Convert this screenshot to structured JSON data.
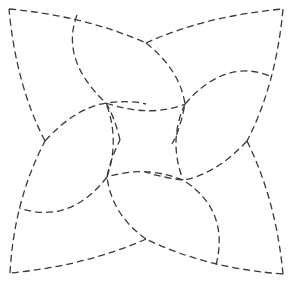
{
  "diagram": {
    "title": "",
    "type": "dashed quilting pinwheel pattern",
    "stroke_color": "#3a3a3a",
    "background": "#ffffff",
    "key_points": {
      "top_left": [
        9,
        9
      ],
      "top_right": [
        283,
        9
      ],
      "bottom_right": [
        283,
        274
      ],
      "bottom_left": [
        10,
        273
      ],
      "top_mid": [
        146,
        43
      ],
      "right_mid": [
        247,
        141
      ],
      "bottom_mid": [
        146,
        239
      ],
      "left_mid": [
        45,
        141
      ],
      "inner_tl": [
        106,
        103
      ],
      "inner_tr": [
        185,
        104
      ],
      "inner_br": [
        183,
        180
      ],
      "inner_bl": [
        107,
        177
      ]
    },
    "paths": [
      {
        "name": "outer-top-left-arc",
        "d": "M9 9 Q85 16 146 43"
      },
      {
        "name": "outer-top-right-arc",
        "d": "M146 43 Q205 16 283 9"
      },
      {
        "name": "outer-right-top-arc",
        "d": "M283 9 Q276 85 247 141"
      },
      {
        "name": "outer-right-bottom-arc",
        "d": "M247 141 Q276 200 283 274"
      },
      {
        "name": "outer-bottom-right-arc",
        "d": "M283 274 Q205 268 146 239"
      },
      {
        "name": "outer-bottom-left-arc",
        "d": "M146 239 Q85 266 10 273"
      },
      {
        "name": "outer-left-bottom-arc",
        "d": "M10 273 Q14 200 45 141"
      },
      {
        "name": "outer-left-top-arc",
        "d": "M45 141 Q16 85 9 9"
      },
      {
        "name": "petal-top-a",
        "d": "M77 15 Q60 60 106 103 Q115 118 120 140"
      },
      {
        "name": "petal-top-b",
        "d": "M106 103 Q150 118 185 104"
      },
      {
        "name": "petal-top-c",
        "d": "M146 43 Q180 70 185 104 Q180 130 172 144"
      },
      {
        "name": "petal-right-a",
        "d": "M185 104 Q225 58 270 76"
      },
      {
        "name": "petal-right-b",
        "d": "M185 104 Q168 140 183 180"
      },
      {
        "name": "petal-right-c",
        "d": "M247 141 Q215 175 183 180 Q165 178 145 172"
      },
      {
        "name": "petal-bottom-a",
        "d": "M216 265 Q230 210 183 180"
      },
      {
        "name": "petal-bottom-b",
        "d": "M183 180 Q145 165 107 177"
      },
      {
        "name": "petal-bottom-c",
        "d": "M146 239 Q112 215 107 177 Q110 160 120 140"
      },
      {
        "name": "petal-left-a",
        "d": "M107 177 Q70 225 19 208"
      },
      {
        "name": "petal-left-b",
        "d": "M107 177 Q120 140 106 103"
      },
      {
        "name": "petal-left-c",
        "d": "M45 141 Q75 108 106 103 Q130 100 146 104"
      }
    ]
  }
}
